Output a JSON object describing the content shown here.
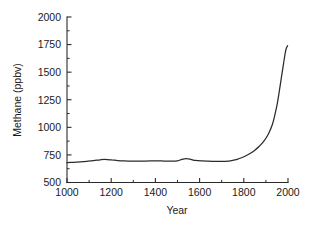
{
  "chart_data": {
    "type": "line",
    "title": "",
    "xlabel": "Year",
    "ylabel": "Methane (ppbv)",
    "xlim": [
      1000,
      2000
    ],
    "ylim": [
      500,
      2000
    ],
    "grid": false,
    "legend": null,
    "x_ticks": [
      1000,
      1200,
      1400,
      1600,
      1800,
      2000
    ],
    "x_tick_labels": [
      "1000",
      "1200",
      "1400",
      "1600",
      "1800",
      "2000"
    ],
    "x_minor_ticks": [
      1100,
      1300,
      1500,
      1700,
      1900
    ],
    "y_ticks": [
      500,
      750,
      1000,
      1250,
      1500,
      1750,
      2000
    ],
    "y_tick_labels": [
      "500",
      "750",
      "1000",
      "1250",
      "1500",
      "1750",
      "2000"
    ],
    "series": [
      {
        "name": "Atmospheric methane",
        "units": "ppbv",
        "x": [
          1000,
          1030,
          1060,
          1090,
          1120,
          1150,
          1170,
          1200,
          1230,
          1260,
          1290,
          1320,
          1350,
          1380,
          1410,
          1440,
          1470,
          1500,
          1520,
          1540,
          1560,
          1580,
          1610,
          1640,
          1670,
          1700,
          1730,
          1750,
          1770,
          1790,
          1810,
          1830,
          1850,
          1870,
          1890,
          1910,
          1930,
          1950,
          1960,
          1970,
          1980,
          1990,
          1998
        ],
        "values": [
          680,
          683,
          687,
          692,
          698,
          706,
          709,
          705,
          699,
          695,
          693,
          693,
          694,
          695,
          696,
          694,
          693,
          696,
          710,
          716,
          710,
          700,
          695,
          693,
          692,
          691,
          694,
          700,
          710,
          724,
          742,
          765,
          793,
          828,
          872,
          935,
          1030,
          1200,
          1320,
          1450,
          1580,
          1700,
          1740
        ]
      }
    ],
    "annotations": []
  },
  "figure": {
    "background_color": "#ffffff",
    "line_color": "#2b2b2b",
    "axis_color": "#2b2b2b",
    "text_color": "#1a1a1a"
  }
}
